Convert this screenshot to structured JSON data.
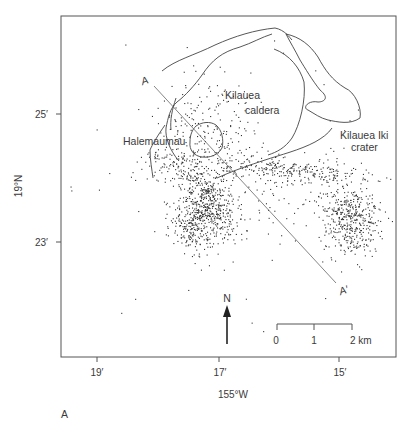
{
  "figure": {
    "panel_label": "A",
    "frame": {
      "x": 61,
      "y": 16,
      "w": 335,
      "h": 341
    }
  },
  "axes": {
    "y_title": "19°N",
    "x_title": "155°W",
    "y_ticks": [
      {
        "label": "25′",
        "y": 114
      },
      {
        "label": "23′",
        "y": 242
      }
    ],
    "x_ticks": [
      {
        "label": "19′",
        "x": 97
      },
      {
        "label": "17′",
        "x": 219
      },
      {
        "label": "15′",
        "x": 339
      }
    ]
  },
  "labels": {
    "kilauea_caldera_1": "Kilauea",
    "kilauea_caldera_2": "caldera",
    "halemaumau": "Halemaumau",
    "kilauea_iki_1": "Kilauea Iki",
    "kilauea_iki_2": "crater",
    "profile_start": "A",
    "profile_end": "A′",
    "north": "N"
  },
  "scale_bar": {
    "ticks": [
      "0",
      "1",
      "2 km"
    ],
    "x0": 277,
    "x1": 314,
    "x2": 352,
    "y": 324
  },
  "profile_line": {
    "x1": 154,
    "y1": 86,
    "x2": 336,
    "y2": 283
  },
  "colors": {
    "ink": "#333333",
    "frame": "#555555",
    "background": "#ffffff"
  },
  "seismicity": {
    "seed": 7,
    "clusters": [
      {
        "name": "southwest-rift-main",
        "cx": 208,
        "cy": 205,
        "sx": 14,
        "sy": 20,
        "n": 520,
        "rot": -0.35
      },
      {
        "name": "southwest-rift-lower",
        "cx": 190,
        "cy": 228,
        "sx": 10,
        "sy": 12,
        "n": 160,
        "rot": -0.4
      },
      {
        "name": "east-rift-cluster",
        "cx": 350,
        "cy": 220,
        "sx": 14,
        "sy": 17,
        "n": 420,
        "rot": 0
      },
      {
        "name": "upper-east-rift-band",
        "cx": 290,
        "cy": 170,
        "sx": 38,
        "sy": 6,
        "n": 260,
        "rot": 0.08
      },
      {
        "name": "caldera-scatter",
        "cx": 210,
        "cy": 125,
        "sx": 28,
        "sy": 26,
        "n": 180,
        "rot": 0
      },
      {
        "name": "halemaumau-south",
        "cx": 185,
        "cy": 165,
        "sx": 20,
        "sy": 10,
        "n": 150,
        "rot": 0
      },
      {
        "name": "mid-scatter",
        "cx": 290,
        "cy": 200,
        "sx": 40,
        "sy": 18,
        "n": 90,
        "rot": 0
      },
      {
        "name": "sparse-wide",
        "cx": 230,
        "cy": 170,
        "sx": 80,
        "sy": 60,
        "n": 70,
        "rot": 0
      }
    ]
  }
}
